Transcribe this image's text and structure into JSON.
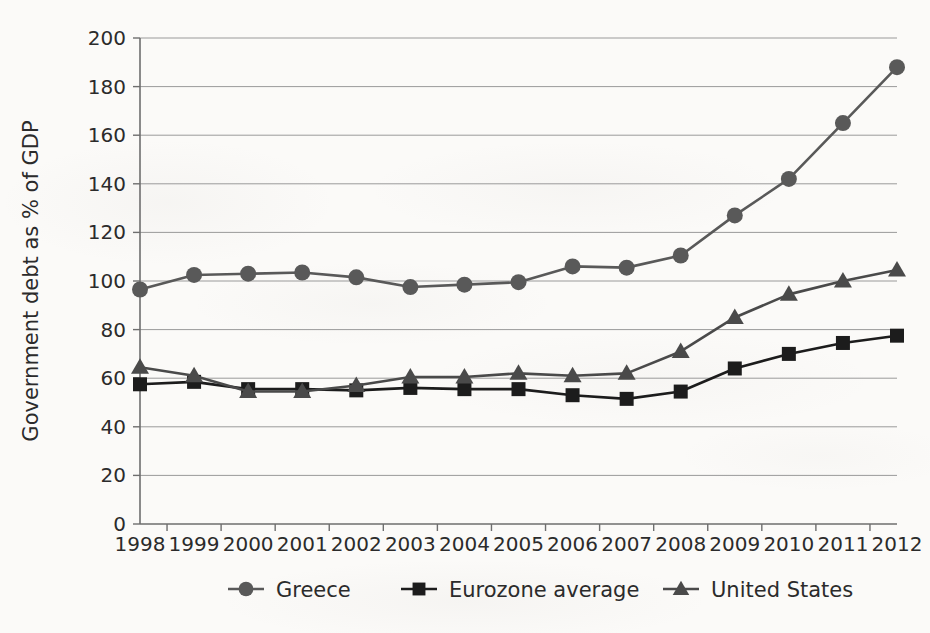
{
  "chart_data": {
    "type": "line",
    "title": "",
    "xlabel": "",
    "ylabel": "Government debt as % of GDP",
    "x": [
      1998,
      1999,
      2000,
      2001,
      2002,
      2003,
      2004,
      2005,
      2006,
      2007,
      2008,
      2009,
      2010,
      2011,
      2012
    ],
    "xtick_labels": [
      "1998",
      "1999",
      "2000",
      "2001",
      "2002",
      "2003",
      "2004",
      "2005",
      "2006",
      "2007",
      "2008",
      "2009",
      "2010",
      "2011",
      "2012"
    ],
    "ytick_labels": [
      "0",
      "20",
      "40",
      "60",
      "80",
      "100",
      "120",
      "140",
      "160",
      "180",
      "200"
    ],
    "ytick_values": [
      0,
      20,
      40,
      60,
      80,
      100,
      120,
      140,
      160,
      180,
      200
    ],
    "ylim": [
      0,
      200
    ],
    "grid": true,
    "legend_position": "bottom",
    "series": [
      {
        "name": "Greece",
        "marker": "circle",
        "color": "#595959",
        "values": [
          96.5,
          102.5,
          103,
          103.5,
          101.5,
          97.5,
          98.5,
          99.5,
          106,
          105.5,
          110.5,
          127,
          142,
          165,
          188
        ]
      },
      {
        "name": "Eurozone average",
        "marker": "square",
        "color": "#1c1c1c",
        "values": [
          57.5,
          58.5,
          55.5,
          55.5,
          55,
          56,
          55.5,
          55.5,
          53,
          51.5,
          54.5,
          64,
          70,
          74.5,
          77.5
        ]
      },
      {
        "name": "United States",
        "marker": "triangle",
        "color": "#4a4a4a",
        "values": [
          64.5,
          61,
          54.5,
          54.5,
          57,
          60.5,
          60.5,
          62,
          61,
          62,
          71,
          85,
          94.5,
          100,
          104.5
        ]
      }
    ]
  },
  "legend": {
    "items": [
      {
        "label": "Greece",
        "marker": "circle-marker"
      },
      {
        "label": "Eurozone average",
        "marker": "square-marker"
      },
      {
        "label": "United States",
        "marker": "triangle-marker"
      }
    ]
  },
  "axis": {
    "y_title": "Government debt as % of GDP"
  },
  "colors": {
    "greece": "#595959",
    "eurozone": "#1c1c1c",
    "united_states": "#4a4a4a",
    "gridline": "#9a9a9a",
    "axis": "#6e6e6e",
    "text": "#2b2b2b",
    "background": "#fbfaf8"
  }
}
